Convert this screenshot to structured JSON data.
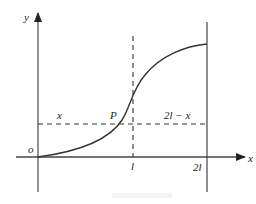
{
  "diagram": {
    "axes": {
      "y_label": "y",
      "x_label": "x",
      "origin_label": "o"
    },
    "points": {
      "P_label": "P"
    },
    "segment_labels": {
      "left": "x",
      "right": "2l − x"
    },
    "tick_labels": {
      "l": "l",
      "two_l": "2l"
    },
    "colors": {
      "stroke": "#333333",
      "axis": "#555555",
      "background": "#ffffff"
    }
  }
}
